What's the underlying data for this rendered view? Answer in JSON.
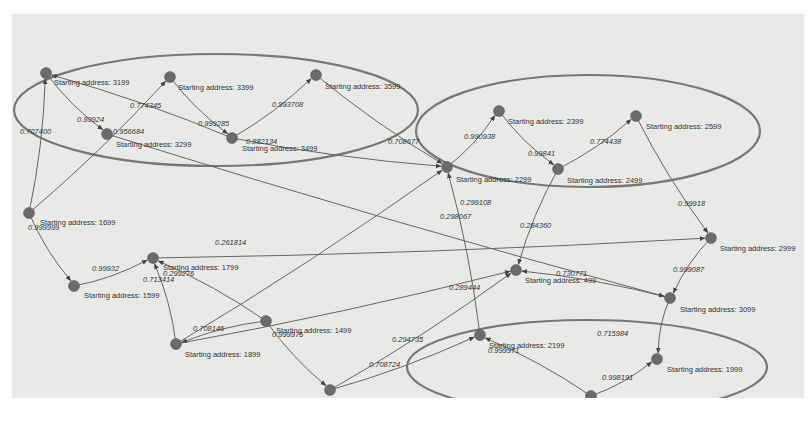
{
  "diagram": {
    "type": "directed-weighted-graph",
    "node_label_prefix": "Starting address: ",
    "colors": {
      "background": "#e9e9e7",
      "node": "#6b6b6b",
      "edge": "#666666",
      "cluster": "#777777"
    },
    "clusters": [
      {
        "id": "cluster-top-left",
        "cx": 216,
        "cy": 110,
        "rx": 202,
        "ry": 56
      },
      {
        "id": "cluster-top-right",
        "cx": 588,
        "cy": 131,
        "rx": 172,
        "ry": 56
      },
      {
        "id": "cluster-bottom-right",
        "cx": 587,
        "cy": 367,
        "rx": 180,
        "ry": 47
      }
    ],
    "nodes": [
      {
        "id": "3199",
        "label": "Starting address: 3199",
        "x": 46,
        "y": 73,
        "lx": 54,
        "ly": 85
      },
      {
        "id": "3399",
        "label": "Starting address: 3399",
        "x": 170,
        "y": 77,
        "lx": 178,
        "ly": 90
      },
      {
        "id": "3599",
        "label": "Starting address: 3599",
        "x": 316,
        "y": 75,
        "lx": 325,
        "ly": 89
      },
      {
        "id": "3299",
        "label": "Starting address: 3299",
        "x": 107,
        "y": 134,
        "lx": 116,
        "ly": 147
      },
      {
        "id": "3499",
        "label": "Starting address: 3499",
        "x": 232,
        "y": 138,
        "lx": 242,
        "ly": 151
      },
      {
        "id": "2399",
        "label": "Starting address: 2399",
        "x": 499,
        "y": 111,
        "lx": 508,
        "ly": 124
      },
      {
        "id": "2599",
        "label": "Starting address: 2599",
        "x": 636,
        "y": 116,
        "lx": 646,
        "ly": 129
      },
      {
        "id": "3299b",
        "label": "Starting address: 2299",
        "x": 447,
        "y": 167,
        "lx": 456,
        "ly": 182
      },
      {
        "id": "2499",
        "label": "Starting address: 2499",
        "x": 558,
        "y": 169,
        "lx": 567,
        "ly": 183
      },
      {
        "id": "1699",
        "label": "Starting address: 1699",
        "x": 29,
        "y": 213,
        "lx": 40,
        "ly": 225
      },
      {
        "id": "2999",
        "label": "Starting address: 2999",
        "x": 711,
        "y": 238,
        "lx": 720,
        "ly": 251
      },
      {
        "id": "1799",
        "label": "Starting address: 1799",
        "x": 153,
        "y": 258,
        "lx": 163,
        "ly": 270
      },
      {
        "id": "1599",
        "label": "Starting address: 1599",
        "x": 74,
        "y": 286,
        "lx": 84,
        "ly": 298
      },
      {
        "id": "499",
        "label": "Starting address: 499",
        "x": 516,
        "y": 270,
        "lx": 525,
        "ly": 283
      },
      {
        "id": "3099",
        "label": "Starting address: 3099",
        "x": 670,
        "y": 298,
        "lx": 680,
        "ly": 312
      },
      {
        "id": "1499",
        "label": "Starting address: 1499",
        "x": 266,
        "y": 321,
        "lx": 276,
        "ly": 333
      },
      {
        "id": "1899",
        "label": "Starting address: 1899",
        "x": 176,
        "y": 344,
        "lx": 185,
        "ly": 357
      },
      {
        "id": "2199",
        "label": "Starting address: 2199",
        "x": 480,
        "y": 335,
        "lx": 489,
        "ly": 348
      },
      {
        "id": "1999",
        "label": "Starting address: 1999",
        "x": 657,
        "y": 359,
        "lx": 667,
        "ly": 372
      },
      {
        "id": "1399",
        "label": "Starting address: 1399",
        "x": 330,
        "y": 390,
        "lx": 339,
        "ly": 403
      },
      {
        "id": "2099",
        "label": "Starting address: 2099",
        "x": 591,
        "y": 396,
        "lx": 600,
        "ly": 409
      }
    ],
    "edges": [
      {
        "from": "1699",
        "to": "3199",
        "weight": "0.707400",
        "lx": 20,
        "ly": 134
      },
      {
        "from": "3199",
        "to": "3299",
        "weight": "0.99924",
        "lx": 77,
        "ly": 122
      },
      {
        "from": "3499",
        "to": "3199",
        "weight": "0.774345",
        "lx": 130,
        "ly": 108
      },
      {
        "from": "3399",
        "to": "3499",
        "weight": "0.999285",
        "lx": 198,
        "ly": 126
      },
      {
        "from": "3499",
        "to": "3599",
        "weight": "0.993708",
        "lx": 272,
        "ly": 107
      },
      {
        "from": "3599",
        "to": "3299b",
        "weight": "0.708677",
        "lx": 388,
        "ly": 144
      },
      {
        "from": "1699",
        "to": "3399",
        "weight": "0.956684",
        "lx": 113,
        "ly": 134
      },
      {
        "from": "3499",
        "to": "2299",
        "weight": "0.882134",
        "lx": 246,
        "ly": 144
      },
      {
        "from": "3299b",
        "to": "2399",
        "weight": "0.990938",
        "lx": 464,
        "ly": 139
      },
      {
        "from": "2399",
        "to": "2499",
        "weight": "0.99841",
        "lx": 528,
        "ly": 156
      },
      {
        "from": "2499",
        "to": "2599",
        "weight": "0.774438",
        "lx": 590,
        "ly": 144
      },
      {
        "from": "2599",
        "to": "2999",
        "weight": "0.99918",
        "lx": 678,
        "ly": 206
      },
      {
        "from": "2999",
        "to": "3099",
        "weight": "0.999087",
        "lx": 673,
        "ly": 272
      },
      {
        "from": "3099",
        "to": "499",
        "weight": "0.730771",
        "lx": 556,
        "ly": 276
      },
      {
        "from": "2499",
        "to": "499",
        "weight": "0.284360",
        "lx": 520,
        "ly": 228
      },
      {
        "from": "1699",
        "to": "1599",
        "weight": "0.999999",
        "lx": 28,
        "ly": 230
      },
      {
        "from": "1599",
        "to": "1799",
        "weight": "0.99932",
        "lx": 92,
        "ly": 271
      },
      {
        "from": "1899",
        "to": "1799",
        "weight": "0.713414",
        "lx": 143,
        "ly": 282
      },
      {
        "from": "1499",
        "to": "1799",
        "weight": "0.299276",
        "lx": 163,
        "ly": 276
      },
      {
        "from": "1899",
        "to": "2299",
        "weight": "0.261814",
        "lx": 215,
        "ly": 245
      },
      {
        "from": "1499",
        "to": "1899",
        "weight": "0.708146",
        "lx": 193,
        "ly": 331
      },
      {
        "from": "1499",
        "to": "1399",
        "weight": "0.999975",
        "lx": 272,
        "ly": 337
      },
      {
        "from": "1399",
        "to": "499",
        "weight": "0.294735",
        "lx": 392,
        "ly": 342
      },
      {
        "from": "1399",
        "to": "2199",
        "weight": "0.708724",
        "lx": 369,
        "ly": 367
      },
      {
        "from": "3099",
        "to": "1999",
        "weight": "0.715984",
        "lx": 597,
        "ly": 336
      },
      {
        "from": "2099",
        "to": "1999",
        "weight": "0.998191",
        "lx": 602,
        "ly": 380
      },
      {
        "from": "2099",
        "to": "2199",
        "weight": "0.999971",
        "lx": 488,
        "ly": 353
      },
      {
        "from": "2199",
        "to": "3299b",
        "weight": "0.299108",
        "lx": 460,
        "ly": 205
      },
      {
        "from": "1799",
        "to": "2999",
        "weight": "0.298067",
        "lx": 440,
        "ly": 219
      },
      {
        "from": "3299",
        "to": "3099",
        "weight": "0.298067b",
        "lx": 440,
        "ly": 219
      },
      {
        "from": "1899",
        "to": "499",
        "weight": "0.289444",
        "lx": 449,
        "ly": 290
      }
    ]
  }
}
